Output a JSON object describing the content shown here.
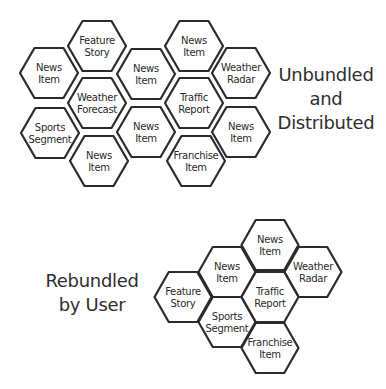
{
  "colors": {
    "stroke": "#2b2b2b",
    "fill": "#ffffff",
    "text": "#2a2a2a"
  },
  "top_cluster": {
    "caption": {
      "lines": [
        "Unbundled",
        "and",
        "Distributed"
      ]
    },
    "hex_size": {
      "w": 58,
      "h": 50
    },
    "hexes": [
      {
        "id": "feature-story",
        "lines": [
          "Feature",
          "Story"
        ],
        "cx": 97,
        "cy": 46
      },
      {
        "id": "news-item-1",
        "lines": [
          "News",
          "Item"
        ],
        "cx": 49,
        "cy": 73
      },
      {
        "id": "news-item-2",
        "lines": [
          "News",
          "Item"
        ],
        "cx": 146,
        "cy": 74
      },
      {
        "id": "news-item-3",
        "lines": [
          "News",
          "Item"
        ],
        "cx": 194,
        "cy": 46
      },
      {
        "id": "weather-radar",
        "lines": [
          "Weather",
          "Radar"
        ],
        "cx": 241,
        "cy": 73
      },
      {
        "id": "weather-forecast",
        "lines": [
          "Weather",
          "Forecast"
        ],
        "cx": 97,
        "cy": 103
      },
      {
        "id": "traffic-report",
        "lines": [
          "Traffic",
          "Report"
        ],
        "cx": 194,
        "cy": 103
      },
      {
        "id": "sports-segment",
        "lines": [
          "Sports",
          "Segment"
        ],
        "cx": 50,
        "cy": 133
      },
      {
        "id": "news-item-4",
        "lines": [
          "News",
          "Item"
        ],
        "cx": 146,
        "cy": 132
      },
      {
        "id": "news-item-5",
        "lines": [
          "News",
          "Item"
        ],
        "cx": 241,
        "cy": 132
      },
      {
        "id": "news-item-6",
        "lines": [
          "News",
          "Item"
        ],
        "cx": 99,
        "cy": 161
      },
      {
        "id": "franchise-item",
        "lines": [
          "Franchise",
          "Item"
        ],
        "cx": 196,
        "cy": 161
      }
    ]
  },
  "bottom_cluster": {
    "caption": {
      "lines": [
        "Rebundled",
        "by User"
      ]
    },
    "hex_size": {
      "w": 57,
      "h": 50
    },
    "hexes": [
      {
        "id": "feature-story",
        "lines": [
          "Feature",
          "Story"
        ],
        "cx": 183,
        "cy": 297
      },
      {
        "id": "news-item-1",
        "lines": [
          "News",
          "Item"
        ],
        "cx": 227,
        "cy": 272
      },
      {
        "id": "news-item-2",
        "lines": [
          "News",
          "Item"
        ],
        "cx": 270,
        "cy": 245
      },
      {
        "id": "weather-radar",
        "lines": [
          "Weather",
          "Radar"
        ],
        "cx": 313,
        "cy": 272
      },
      {
        "id": "traffic-report",
        "lines": [
          "Traffic",
          "Report"
        ],
        "cx": 270,
        "cy": 297
      },
      {
        "id": "sports-segment",
        "lines": [
          "Sports",
          "Segment"
        ],
        "cx": 227,
        "cy": 322
      },
      {
        "id": "franchise-item",
        "lines": [
          "Franchise",
          "Item"
        ],
        "cx": 270,
        "cy": 348
      }
    ]
  }
}
